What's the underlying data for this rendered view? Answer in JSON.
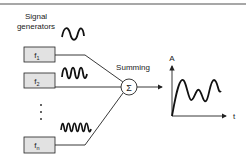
{
  "header": {
    "label_line1": "Signal",
    "label_line2": "generators"
  },
  "generators": [
    {
      "base": "f",
      "sub": "1"
    },
    {
      "base": "f",
      "sub": "2"
    },
    {
      "base": "f",
      "sub": "n"
    }
  ],
  "ellipsis": "⋮",
  "summer": {
    "label": "Summing",
    "symbol": "Σ"
  },
  "output_plot": {
    "y_axis_label": "A",
    "x_axis_label": "t"
  },
  "colors": {
    "box_fill": "#e2e2e2",
    "stroke": "#222222",
    "rule": "#8a8a8a"
  }
}
